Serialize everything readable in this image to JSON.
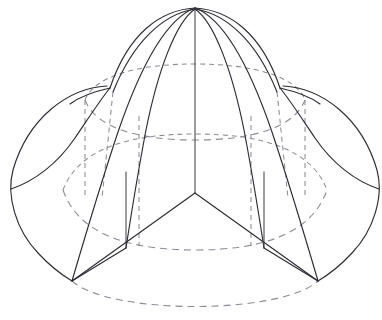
{
  "figure": {
    "background_color": "#ffffff",
    "solid_line_color": "#2b2b33",
    "dashed_line_color": "#8c8c96",
    "canvas": {
      "width": 382,
      "height": 320
    },
    "key_points": {
      "apex": {
        "x": 195,
        "y": 8,
        "label": "apex"
      },
      "center_junction": {
        "x": 195,
        "y": 193,
        "label": "central-y-junction"
      },
      "left_vertex": {
        "x": 72,
        "y": 281,
        "label": "bottom-left-vertex"
      },
      "right_vertex": {
        "x": 318,
        "y": 281,
        "label": "bottom-right-vertex"
      },
      "left_extreme": {
        "x": 11,
        "y": 189,
        "label": "left-extreme"
      },
      "right_extreme": {
        "x": 379,
        "y": 189,
        "label": "right-extreme"
      },
      "left_cusp": {
        "x": 110,
        "y": 88,
        "label": "left-cusp"
      },
      "right_cusp": {
        "x": 280,
        "y": 88,
        "label": "right-cusp"
      }
    },
    "elements": {
      "outer_silhouette": "outer-silhouette-outline",
      "central_axis": "central-vertical-axis",
      "upper_rim_ellipse": "upper-cylinder-rim-dashed",
      "lower_rim_ellipse": "lower-cylinder-rim-dashed",
      "base_ellipse": "base-circle-dashed",
      "left_lobe": "left-lobe-arc",
      "right_lobe": "right-lobe-arc",
      "front_seam_left": "front-seam-left",
      "front_seam_right": "front-seam-right",
      "cylinder_wall_left_solid": "cylinder-wall-left-solid",
      "cylinder_wall_right_solid": "cylinder-wall-right-solid",
      "cylinder_wall_left_dashed": "cylinder-wall-left-dashed",
      "cylinder_wall_right_dashed": "cylinder-wall-right-dashed"
    },
    "caption": ""
  }
}
